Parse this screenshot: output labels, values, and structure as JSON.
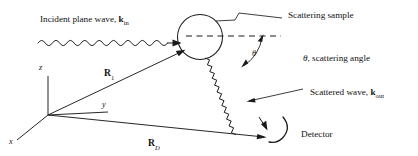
{
  "figure": {
    "background_color": "#ffffff",
    "line_color": "#1a1a1a",
    "text_color": "#111111"
  },
  "labels": {
    "incident_wave": "Incident plane wave, ",
    "incident_wave_k": "k",
    "incident_wave_sub": "in",
    "scattering_sample": "Scattering sample",
    "scattering_angle": ", scattering angle",
    "scattering_angle_symbol": "θ",
    "scattered_wave": "Scattered wave, ",
    "scattered_wave_k": "k",
    "scattered_wave_sub": "out",
    "detector": "Detector",
    "theta_arc": "θ"
  },
  "axes": {
    "x": "x",
    "y": "y",
    "z": "z"
  },
  "vectors": [
    {
      "name": "R_1",
      "symbol": "R",
      "subscript": "1",
      "subscript_italic": false
    },
    {
      "name": "R_D",
      "symbol": "R",
      "subscript": "D",
      "subscript_italic": true
    }
  ],
  "elements": {
    "sample_shape": "circle",
    "detector_shape": "curved-arc",
    "incident_wave_shape": "sine-wave-arrow",
    "scattered_wave_shape": "zigzag-wave-arrow",
    "optical_axis_shape": "dashed-line"
  }
}
